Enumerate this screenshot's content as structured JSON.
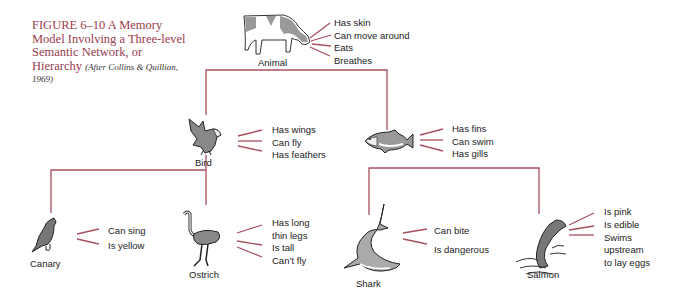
{
  "figure": {
    "number": "FIGURE 6–10",
    "title": "A Memory Model Involving a Three-level Semantic Network, or Hierarchy",
    "title_line1": "FIGURE 6–10   A Memory",
    "title_line2": "Model Involving a Three-level",
    "title_line3": "Semantic Network, or",
    "title_line4": "Hierarchy",
    "citation_a": "(After Collins & Quillian,",
    "citation_b": "1969)"
  },
  "colors": {
    "accent": "#9a3b4e",
    "line": "#a8505f",
    "text": "#222222"
  },
  "nodes": {
    "animal": {
      "label": "Animal",
      "icon": "cow-icon",
      "properties": [
        "Has skin",
        "Can move around",
        "Eats",
        "Breathes"
      ]
    },
    "bird": {
      "label": "Bird",
      "icon": "eagle-icon",
      "properties": [
        "Has wings",
        "Can fly",
        "Has feathers"
      ]
    },
    "fish": {
      "label": "",
      "icon": "fish-icon",
      "properties": [
        "Has fins",
        "Can swim",
        "Has gills"
      ]
    },
    "canary": {
      "label": "Canary",
      "icon": "canary-icon",
      "properties": [
        "Can sing",
        "Is yellow"
      ]
    },
    "ostrich": {
      "label": "Ostrich",
      "icon": "ostrich-icon",
      "properties": [
        "Has long thin legs",
        "Is tall",
        "Can't fly"
      ],
      "properties_display": [
        "Has long",
        "thin legs",
        "Is tall",
        "Can’t fly"
      ]
    },
    "shark": {
      "label": "Shark",
      "icon": "shark-icon",
      "properties": [
        "Can bite",
        "Is dangerous"
      ]
    },
    "salmon": {
      "label": "Salmon",
      "icon": "salmon-icon",
      "properties": [
        "Is pink",
        "Is edible",
        "Swims upstream to lay eggs"
      ],
      "properties_display": [
        "Is pink",
        "Is edible",
        "Swims",
        "upstream",
        "to lay eggs"
      ]
    }
  },
  "edges": [
    [
      "animal",
      "bird"
    ],
    [
      "animal",
      "fish"
    ],
    [
      "bird",
      "canary"
    ],
    [
      "bird",
      "ostrich"
    ],
    [
      "fish",
      "shark"
    ],
    [
      "fish",
      "salmon"
    ]
  ]
}
